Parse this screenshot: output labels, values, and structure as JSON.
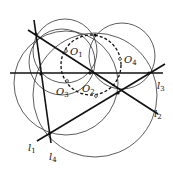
{
  "diagram": {
    "lines": [
      {
        "id": "l1",
        "label": "l",
        "sub": "1",
        "x1": 37,
        "y1": 141,
        "x2": 165,
        "y2": 64,
        "lx": 28,
        "ly": 151
      },
      {
        "id": "l2",
        "label": "l",
        "sub": "2",
        "x1": 28,
        "y1": 30,
        "x2": 158,
        "y2": 114,
        "lx": 154,
        "ly": 117
      },
      {
        "id": "l3",
        "label": "l",
        "sub": "3",
        "x1": 10,
        "y1": 73,
        "x2": 163,
        "y2": 73,
        "lx": 157,
        "ly": 89
      },
      {
        "id": "l4",
        "label": "l",
        "sub": "4",
        "x1": 34,
        "y1": 20,
        "x2": 51,
        "y2": 143,
        "lx": 49,
        "ly": 160
      }
    ],
    "circles": [
      {
        "id": "c1",
        "cx": 65,
        "cy": 51,
        "r": 32
      },
      {
        "id": "c2",
        "cx": 95,
        "cy": 95,
        "r": 62
      },
      {
        "id": "c3",
        "cx": 66,
        "cy": 83,
        "r": 52
      },
      {
        "id": "c4",
        "cx": 122,
        "cy": 56,
        "r": 33
      },
      {
        "id": "c5",
        "cx": 62,
        "cy": 62,
        "r": 33
      }
    ],
    "dashed_circle": {
      "cx": 91,
      "cy": 65,
      "r": 30
    },
    "centers": [
      {
        "label": "O",
        "sub": "1",
        "x": 66,
        "y": 51,
        "lx": 70,
        "ly": 55
      },
      {
        "label": "O",
        "sub": "2",
        "x": 96,
        "y": 96,
        "lx": 82,
        "ly": 92
      },
      {
        "label": "O",
        "sub": "3",
        "x": 67,
        "y": 81,
        "lx": 56,
        "ly": 95
      },
      {
        "label": "O",
        "sub": "4",
        "x": 120,
        "y": 59,
        "lx": 124,
        "ly": 63
      }
    ],
    "points": [
      {
        "x": 36,
        "y": 34
      },
      {
        "x": 41,
        "y": 74
      },
      {
        "x": 90,
        "y": 73
      },
      {
        "x": 118,
        "y": 93
      },
      {
        "x": 149,
        "y": 73
      },
      {
        "x": 50,
        "y": 133
      },
      {
        "x": 95,
        "y": 35
      }
    ]
  }
}
